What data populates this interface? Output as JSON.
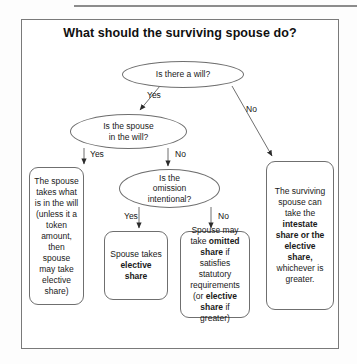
{
  "diagram": {
    "title": "What should the surviving spouse do?",
    "type": "flowchart",
    "nodes": {
      "will_question": "Is there a will?",
      "spouse_in_will_question": "Is the spouse\nin the will?",
      "omission_question": "Is the\nomission\nintentional?",
      "takes_what_is_in_will": "The spouse takes what is in the will (unless it a token amount, then spouse may take elective share)",
      "elective_share_box": "Spouse takes elective share",
      "omitted_share_box": "Spouse may take omitted share if satisfies statutory requirements (or elective share if greater)",
      "intestate_box": "The surviving spouse can take the intestate share or the elective share, whichever is greater."
    },
    "edge_labels": {
      "will_yes": "Yes",
      "will_no": "No",
      "in_will_yes": "Yes",
      "in_will_no": "No",
      "omission_yes": "Yes",
      "omission_no": "No"
    }
  }
}
